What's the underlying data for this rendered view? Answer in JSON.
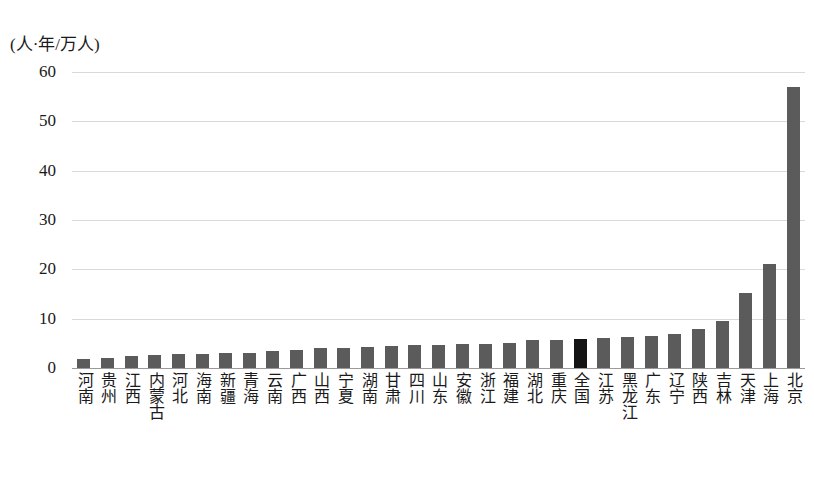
{
  "chart_data": {
    "type": "bar",
    "title": "",
    "subtitle": "",
    "xlabel": "",
    "ylabel": "(人·年/万人)",
    "ylim": [
      0,
      60
    ],
    "yticks": [
      0,
      10,
      20,
      30,
      40,
      50,
      60
    ],
    "ytick_labels": [
      "0",
      "10",
      "20",
      "30",
      "40",
      "50",
      "60"
    ],
    "grid": true,
    "legend": "none",
    "categories": [
      "河南",
      "贵州",
      "江西",
      "内蒙古",
      "河北",
      "海南",
      "新疆",
      "青海",
      "云南",
      "广西",
      "山西",
      "宁夏",
      "湖南",
      "甘肃",
      "四川",
      "山东",
      "安徽",
      "浙江",
      "福建",
      "湖北",
      "重庆",
      "全国",
      "江苏",
      "黑龙江",
      "广东",
      "辽宁",
      "陕西",
      "吉林",
      "天津",
      "上海",
      "北京"
    ],
    "values": [
      1.8,
      2.1,
      2.4,
      2.7,
      2.8,
      2.9,
      3.0,
      3.1,
      3.4,
      3.7,
      4.0,
      4.1,
      4.2,
      4.5,
      4.6,
      4.7,
      4.8,
      4.9,
      5.0,
      5.6,
      5.7,
      5.8,
      6.1,
      6.2,
      6.4,
      6.8,
      8.0,
      9.5,
      15.2,
      21.0,
      57.0
    ],
    "highlight_category": "全国",
    "bar_color": "#5b5b5b",
    "highlight_color": "#141414",
    "gridline_color": "#d9d9d9",
    "axis_color": "#9a9a9a",
    "background": "#ffffff"
  }
}
